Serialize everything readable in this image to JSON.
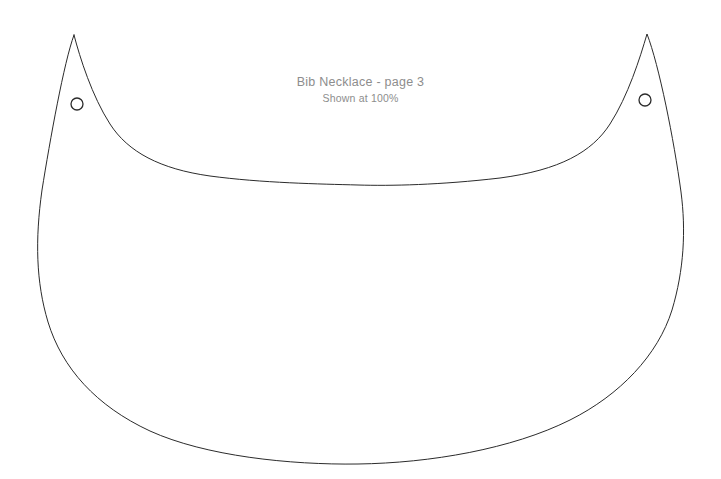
{
  "document": {
    "background_color": "#ffffff",
    "width": 721,
    "height": 479
  },
  "label": {
    "title": "Bib Necklace - page 3",
    "subtitle": "Shown at 100%",
    "color": "#8d8d8d"
  },
  "pattern": {
    "name": "bib-necklace-cutting-template",
    "stroke_color": "#2b2b2b",
    "stroke_width": 1,
    "fill": "none",
    "outline_path": "M 74 35 C 64 62, 50 140, 42 190 C 35 240, 36 282, 48 322 C 62 368, 96 406, 150 431 C 205 456, 290 465, 358 464 C 430 463, 512 449, 570 420 C 620 395, 658 355, 672 310 C 684 270, 686 230, 681 192 C 674 140, 659 65, 647 34 C 640 58, 628 96, 610 124 C 592 152, 560 170, 500 178 C 440 185, 390 186, 358 185 C 320 184, 262 183, 210 176 C 160 169, 128 152, 110 124 C 92 96, 80 58, 74 35 Z",
    "holes": [
      {
        "name": "left-cord-hole",
        "cx": 77,
        "cy": 104,
        "r": 6
      },
      {
        "name": "right-cord-hole",
        "cx": 645,
        "cy": 100,
        "r": 6
      }
    ]
  }
}
